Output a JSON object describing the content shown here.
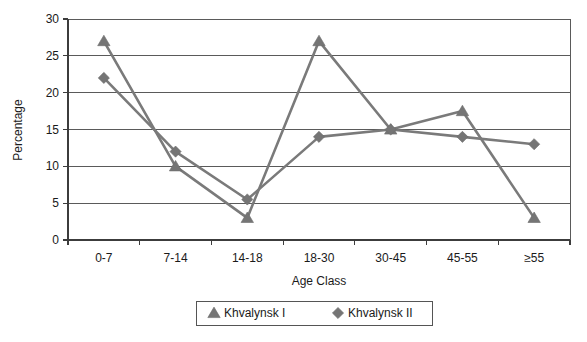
{
  "chart_data": {
    "type": "line",
    "title": "",
    "xlabel": "Age Class",
    "ylabel": "Percentage",
    "categories": [
      "0-7",
      "7-14",
      "14-18",
      "18-30",
      "30-45",
      "45-55",
      "≥55"
    ],
    "ylim": [
      0,
      30
    ],
    "yticks": [
      0,
      5,
      10,
      15,
      20,
      25,
      30
    ],
    "ytick_labels": [
      "0",
      "5",
      "10",
      "15",
      "20",
      "25",
      "30"
    ],
    "grid": true,
    "legend_position": "bottom",
    "series": [
      {
        "name": "Khvalynsk I",
        "marker": "triangle",
        "color": "#757575",
        "values": [
          27,
          10,
          3,
          27,
          15,
          17.5,
          3
        ]
      },
      {
        "name": "Khvalynsk II",
        "marker": "diamond",
        "color": "#757575",
        "values": [
          22,
          12,
          5.5,
          14,
          15,
          14,
          13
        ]
      }
    ]
  },
  "axes": {
    "y_title": "Percentage",
    "x_title": "Age Class"
  },
  "legend": {
    "items": [
      {
        "label": "Khvalynsk I",
        "marker": "triangle"
      },
      {
        "label": "Khvalynsk II",
        "marker": "diamond"
      }
    ]
  }
}
